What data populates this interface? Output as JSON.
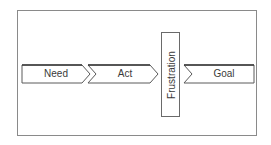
{
  "diagram": {
    "steps": [
      {
        "label": "Need"
      },
      {
        "label": "Act"
      },
      {
        "label": "Frustration"
      },
      {
        "label": "Goal"
      }
    ],
    "colors": {
      "stroke": "#5a5a5a",
      "frame": "#8a8a8a",
      "text": "#3a3a3a",
      "background": "#ffffff"
    }
  }
}
